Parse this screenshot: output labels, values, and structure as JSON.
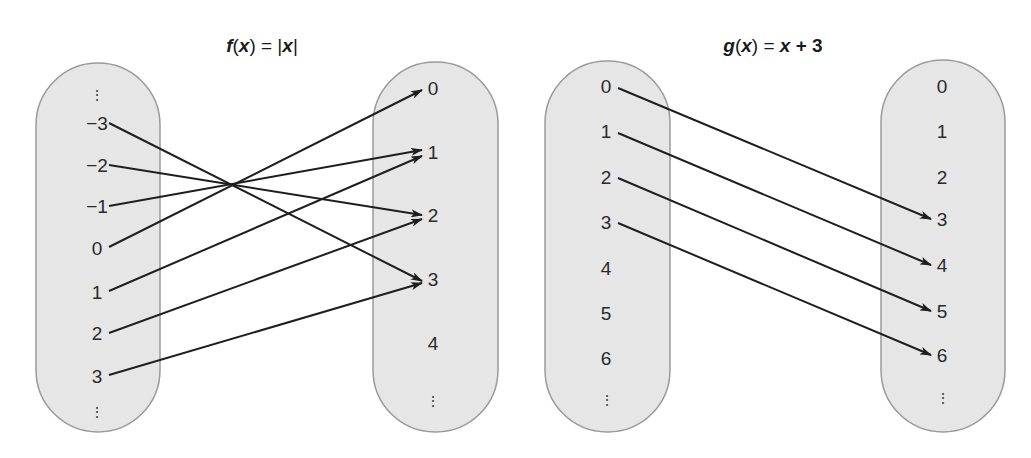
{
  "diagrams": [
    {
      "id": "f",
      "title": {
        "fn": "f",
        "arg": "x",
        "rhs": "|x|",
        "text": "f(x) = |x|"
      },
      "title_pos": {
        "x": 262,
        "y": 45
      },
      "domain_oval": {
        "x": 36,
        "y": 63,
        "w": 124,
        "h": 369
      },
      "range_oval": {
        "x": 373,
        "y": 62,
        "w": 125,
        "h": 370
      },
      "domain": [
        {
          "label": "⋮",
          "x": 97,
          "y": 95,
          "dots": true
        },
        {
          "label": "−3",
          "x": 97,
          "y": 123
        },
        {
          "label": "−2",
          "x": 97,
          "y": 165
        },
        {
          "label": "−1",
          "x": 97,
          "y": 206
        },
        {
          "label": "0",
          "x": 97,
          "y": 248
        },
        {
          "label": "1",
          "x": 97,
          "y": 292
        },
        {
          "label": "2",
          "x": 97,
          "y": 333
        },
        {
          "label": "3",
          "x": 97,
          "y": 376
        },
        {
          "label": "⋮",
          "x": 97,
          "y": 412,
          "dots": true
        }
      ],
      "range": [
        {
          "label": "0",
          "x": 433,
          "y": 88
        },
        {
          "label": "1",
          "x": 433,
          "y": 152
        },
        {
          "label": "2",
          "x": 433,
          "y": 215
        },
        {
          "label": "3",
          "x": 433,
          "y": 279
        },
        {
          "label": "4",
          "x": 433,
          "y": 343
        },
        {
          "label": "⋮",
          "x": 433,
          "y": 401,
          "dots": true
        }
      ],
      "mappings": [
        {
          "from": "−3",
          "to": "3",
          "x1": 109,
          "y1": 123,
          "x2": 422,
          "y2": 281
        },
        {
          "from": "−2",
          "to": "2",
          "x1": 109,
          "y1": 165,
          "x2": 422,
          "y2": 215
        },
        {
          "from": "−1",
          "to": "1",
          "x1": 109,
          "y1": 206,
          "x2": 422,
          "y2": 150
        },
        {
          "from": "0",
          "to": "0",
          "x1": 109,
          "y1": 247,
          "x2": 422,
          "y2": 90
        },
        {
          "from": "1",
          "to": "1",
          "x1": 109,
          "y1": 291,
          "x2": 422,
          "y2": 156
        },
        {
          "from": "2",
          "to": "2",
          "x1": 109,
          "y1": 333,
          "x2": 422,
          "y2": 219
        },
        {
          "from": "3",
          "to": "3",
          "x1": 109,
          "y1": 375,
          "x2": 422,
          "y2": 283
        }
      ]
    },
    {
      "id": "g",
      "title": {
        "fn": "g",
        "arg": "x",
        "rhs": "x + 3",
        "text": "g(x) = x + 3"
      },
      "title_pos": {
        "x": 773,
        "y": 45
      },
      "domain_oval": {
        "x": 545,
        "y": 61,
        "w": 125,
        "h": 371
      },
      "range_oval": {
        "x": 881,
        "y": 60,
        "w": 124,
        "h": 372
      },
      "domain": [
        {
          "label": "0",
          "x": 606,
          "y": 86
        },
        {
          "label": "1",
          "x": 606,
          "y": 131
        },
        {
          "label": "2",
          "x": 606,
          "y": 177
        },
        {
          "label": "3",
          "x": 606,
          "y": 222
        },
        {
          "label": "4",
          "x": 606,
          "y": 268
        },
        {
          "label": "5",
          "x": 606,
          "y": 313
        },
        {
          "label": "6",
          "x": 606,
          "y": 358
        },
        {
          "label": "⋮",
          "x": 607,
          "y": 400,
          "dots": true
        }
      ],
      "range": [
        {
          "label": "0",
          "x": 942,
          "y": 86
        },
        {
          "label": "1",
          "x": 942,
          "y": 131
        },
        {
          "label": "2",
          "x": 942,
          "y": 177
        },
        {
          "label": "3",
          "x": 942,
          "y": 219
        },
        {
          "label": "4",
          "x": 942,
          "y": 265
        },
        {
          "label": "5",
          "x": 942,
          "y": 311
        },
        {
          "label": "6",
          "x": 942,
          "y": 355
        },
        {
          "label": "⋮",
          "x": 943,
          "y": 398,
          "dots": true
        }
      ],
      "mappings": [
        {
          "from": "0",
          "to": "3",
          "x1": 618,
          "y1": 88,
          "x2": 931,
          "y2": 219
        },
        {
          "from": "1",
          "to": "4",
          "x1": 618,
          "y1": 133,
          "x2": 931,
          "y2": 265
        },
        {
          "from": "2",
          "to": "5",
          "x1": 618,
          "y1": 178,
          "x2": 931,
          "y2": 311
        },
        {
          "from": "3",
          "to": "6",
          "x1": 618,
          "y1": 223,
          "x2": 931,
          "y2": 355
        }
      ]
    }
  ]
}
